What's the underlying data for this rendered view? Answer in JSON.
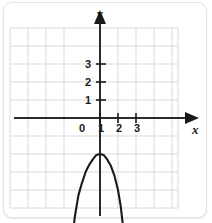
{
  "chart_data": {
    "type": "line",
    "title": "",
    "xlabel": "x",
    "ylabel": "y",
    "grid": true,
    "legend": false,
    "xlim": [
      -4,
      5.3
    ],
    "ylim": [
      -5,
      5.2
    ],
    "x_tick_labels": [
      "1",
      "2",
      "3"
    ],
    "x_tick_values": [
      1,
      2,
      3
    ],
    "y_tick_labels": [
      "1",
      "2",
      "3"
    ],
    "y_tick_values": [
      1,
      2,
      3
    ],
    "origin_label": "0",
    "curve": {
      "name": "parabola",
      "shape": "downward-opening parabola",
      "vertex": [
        0,
        -2
      ],
      "equation": "y = -2x^2 - 2",
      "color": "#1a1a1a",
      "points": [
        [
          -1.55,
          -6.8
        ],
        [
          -1.4,
          -5.5
        ],
        [
          -1.2,
          -4.3
        ],
        [
          -1.0,
          -3.6
        ],
        [
          -0.8,
          -3.0
        ],
        [
          -0.6,
          -2.6
        ],
        [
          -0.4,
          -2.3
        ],
        [
          -0.2,
          -2.05
        ],
        [
          0.0,
          -2.0
        ],
        [
          0.2,
          -2.05
        ],
        [
          0.4,
          -2.3
        ],
        [
          0.6,
          -2.65
        ],
        [
          0.8,
          -3.2
        ],
        [
          1.0,
          -4.0
        ],
        [
          1.15,
          -4.9
        ],
        [
          1.3,
          -6.2
        ],
        [
          1.4,
          -7.0
        ]
      ]
    },
    "axes": {
      "x_axis_arrow": "right",
      "y_axis_arrow": "up",
      "axis_color": "#2b2b2b"
    },
    "colors": {
      "grid": "#d7d7d7",
      "axis": "#2b2b2b",
      "curve": "#1a1a1a",
      "background": "#ffffff",
      "card_border": "#e3e3e3"
    }
  }
}
